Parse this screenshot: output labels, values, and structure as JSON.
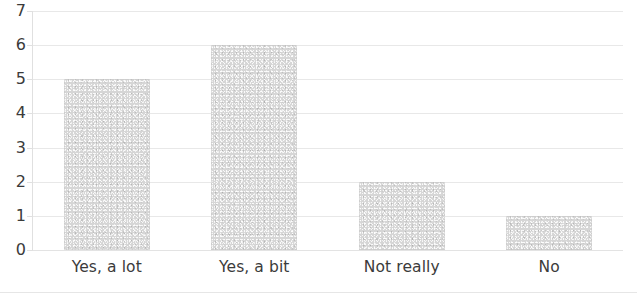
{
  "chart_data": {
    "type": "bar",
    "title": "",
    "subtitle": "",
    "xlabel": "",
    "ylabel": "",
    "categories": [
      "Yes, a lot",
      "Yes, a bit",
      "Not really",
      "No"
    ],
    "values": [
      5,
      6,
      2,
      1
    ],
    "ylim": [
      0,
      7
    ],
    "ytick_labels": [
      "0",
      "1",
      "2",
      "3",
      "4",
      "5",
      "6",
      "7"
    ],
    "ytick_values": [
      0,
      1,
      2,
      3,
      4,
      5,
      6,
      7
    ],
    "grid": "horizontal",
    "legend": "none",
    "bar_color": "#d6d6d6",
    "text_color": "#3b3b3b",
    "gridline_color": "#e4e4e4",
    "background_color": "#ffffff"
  }
}
